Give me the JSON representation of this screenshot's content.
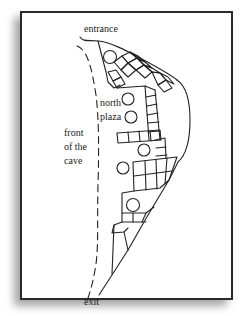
{
  "diagram": {
    "type": "site-plan",
    "labels": {
      "entrance": "entrance",
      "north_plaza_line1": "north",
      "north_plaza_line2": "plaza",
      "front_line1": "front",
      "front_line2": "of the",
      "front_line3": "cave",
      "exit": "exit"
    },
    "colors": {
      "line": "#222222",
      "frame": "#2a2a2a",
      "background": "#ffffff"
    },
    "elements": {
      "dashed_line": "front of the cave boundary",
      "outline": "cave wall / building cluster outline",
      "circles": 6,
      "room_grid": "rectangular rooms along cave wall"
    }
  }
}
